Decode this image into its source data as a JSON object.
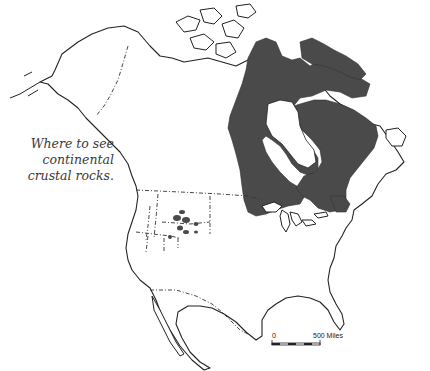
{
  "map": {
    "caption": {
      "lines": [
        "Where to see",
        "continental",
        "crustal rocks."
      ]
    },
    "region_highlighted": "continental crustal rocks (Canadian Shield and Rocky Mountain exposures)",
    "colors": {
      "shield_fill": "#4a4a4a",
      "outline": "#222222",
      "background": "#ffffff"
    },
    "scale_bar": {
      "start_label": "0",
      "end_label": "500 Miles"
    }
  }
}
